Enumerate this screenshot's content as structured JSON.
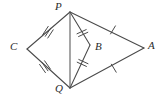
{
  "figure": {
    "kind": "geometry-diagram",
    "background_color": "#ffffff",
    "stroke_color": "#4a4a4a",
    "label_color": "#2b2b2b",
    "width": 163,
    "height": 99,
    "points": [
      {
        "id": "P",
        "label": "P",
        "x": 70,
        "y": 12
      },
      {
        "id": "C",
        "label": "C",
        "x": 27,
        "y": 49
      },
      {
        "id": "A",
        "label": "A",
        "x": 144,
        "y": 48
      },
      {
        "id": "Q",
        "label": "Q",
        "x": 70,
        "y": 88
      },
      {
        "id": "B",
        "label": "B",
        "x": 90,
        "y": 45
      }
    ],
    "segments": [
      {
        "id": "CP",
        "from": "C",
        "to": "P",
        "ticks": 3
      },
      {
        "id": "CQ",
        "from": "C",
        "to": "Q",
        "ticks": 3
      },
      {
        "id": "PA",
        "from": "P",
        "to": "A",
        "ticks": 1
      },
      {
        "id": "QA",
        "from": "Q",
        "to": "A",
        "ticks": 1
      },
      {
        "id": "PB",
        "from": "P",
        "to": "B",
        "ticks": 2
      },
      {
        "id": "BQ",
        "from": "B",
        "to": "Q",
        "ticks": 2
      },
      {
        "id": "PQ",
        "from": "P",
        "to": "Q",
        "ticks": 0
      }
    ],
    "tick_marks": [
      {
        "id": "ticks-CP",
        "on": "CP",
        "count": 3,
        "x": 47,
        "y": 30
      },
      {
        "id": "ticks-CQ",
        "on": "CQ",
        "count": 3,
        "x": 45,
        "y": 69
      },
      {
        "id": "ticks-PA",
        "on": "PA",
        "count": 1,
        "x": 113,
        "y": 30
      },
      {
        "id": "ticks-QA",
        "on": "QA",
        "count": 1,
        "x": 114,
        "y": 68
      },
      {
        "id": "ticks-PB",
        "on": "PB",
        "count": 2,
        "x": 82,
        "y": 32
      },
      {
        "id": "ticks-BQ",
        "on": "BQ",
        "count": 2,
        "x": 82,
        "y": 64
      }
    ]
  }
}
